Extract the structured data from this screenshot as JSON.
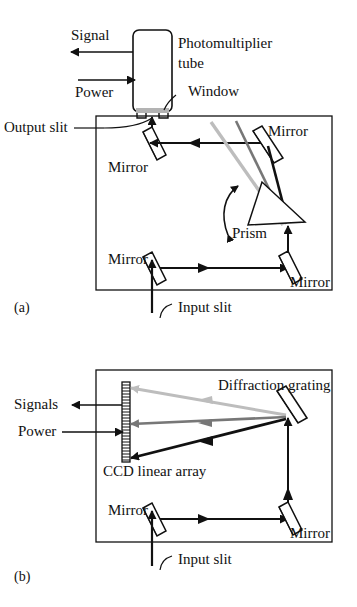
{
  "figure": {
    "type": "optical-spectrometer-schematic",
    "panels": [
      {
        "id": "a",
        "caption": "(a)",
        "dispersing_element": "Prism",
        "detector": "Photomultiplier tube",
        "labels": {
          "signal": "Signal",
          "power": "Power",
          "detector": "Photomultiplier",
          "detector_line2": "tube",
          "window": "Window",
          "output_slit": "Output slit",
          "mirror_upper_left": "Mirror",
          "mirror_upper_right": "Mirror",
          "mirror_lower_left": "Mirror",
          "mirror_lower_right": "Mirror",
          "prism": "Prism",
          "input_slit": "Input slit"
        }
      },
      {
        "id": "b",
        "caption": "(b)",
        "dispersing_element": "Diffraction grating",
        "detector": "CCD linear array",
        "labels": {
          "signals": "Signals",
          "power": "Power",
          "grating": "Diffraction grating",
          "ccd": "CCD linear array",
          "mirror_left": "Mirror",
          "mirror_right": "Mirror",
          "input_slit": "Input slit"
        }
      }
    ],
    "colors": {
      "ink": "#111111",
      "ray_black": "#111111",
      "ray_mid_gray": "#777777",
      "ray_light_gray": "#bdbdbd",
      "window_fill": "#b3b3b3",
      "background": "#ffffff"
    }
  }
}
